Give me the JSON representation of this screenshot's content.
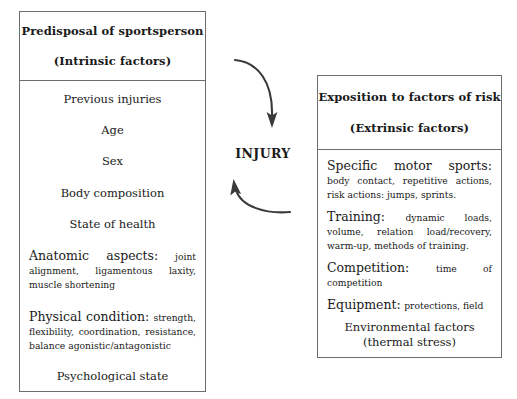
{
  "diagram": {
    "center_label": "INJURY",
    "left_box": {
      "header_line1": "Predisposal of sportsperson",
      "header_line2": "(Intrinsic factors)",
      "items": [
        {
          "type": "centered",
          "text": "Previous injuries"
        },
        {
          "type": "centered",
          "text": "Age"
        },
        {
          "type": "centered",
          "text": "Sex"
        },
        {
          "type": "centered",
          "text": "Body composition"
        },
        {
          "type": "centered",
          "text": "State of health"
        },
        {
          "type": "detail",
          "lead": "Anatomic aspects:",
          "sub": "joint alignment, ligamentous laxity, muscle shortening"
        },
        {
          "type": "detail",
          "lead": "Physical condition:",
          "sub": "strength, flexibility, coordination, resistance, balance agonistic/antagonistic"
        },
        {
          "type": "centered",
          "text": "Psychological state"
        }
      ]
    },
    "right_box": {
      "header_line1": "Exposition to factors of risk",
      "header_line2": "(Extrinsic factors)",
      "items": [
        {
          "type": "detail",
          "lead": "Specific motor sports:",
          "sub": "body contact, repetitive actions, risk actions: jumps, sprints."
        },
        {
          "type": "detail",
          "lead": "Training:",
          "sub": "dynamic loads, volume, relation load/recovery, warm-up, methods of training."
        },
        {
          "type": "detail",
          "lead": "Competition:",
          "sub": "time of competition"
        },
        {
          "type": "detail",
          "lead": "Equipment:",
          "sub": "protections, field"
        },
        {
          "type": "env",
          "line1": "Environmental factors",
          "line2": "(thermal stress)"
        }
      ]
    },
    "arrows": [
      {
        "name": "arrow-intrinsic-to-injury",
        "direction": "down"
      },
      {
        "name": "arrow-extrinsic-to-injury",
        "direction": "up"
      }
    ],
    "colors": {
      "border": "#6d6d6d",
      "text": "#1a1a1a",
      "arrow": "#3a3a3a",
      "background": "#ffffff"
    }
  }
}
